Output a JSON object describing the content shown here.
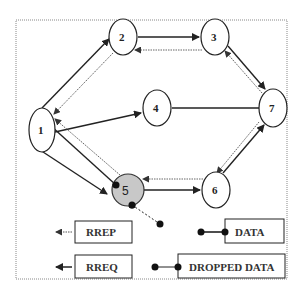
{
  "diagram": {
    "type": "network-routing",
    "nodes": [
      {
        "id": "1",
        "label": "1"
      },
      {
        "id": "2",
        "label": "2"
      },
      {
        "id": "3",
        "label": "3"
      },
      {
        "id": "4",
        "label": "4"
      },
      {
        "id": "5",
        "label": "5",
        "highlighted": true,
        "fill": "#c8c8c8"
      },
      {
        "id": "6",
        "label": "6"
      },
      {
        "id": "7",
        "label": "7"
      }
    ],
    "edges": [
      {
        "from": "1",
        "to": "2",
        "type": "RREQ"
      },
      {
        "from": "2",
        "to": "1",
        "type": "RREP"
      },
      {
        "from": "2",
        "to": "3",
        "type": "RREQ"
      },
      {
        "from": "3",
        "to": "2",
        "type": "RREP"
      },
      {
        "from": "3",
        "to": "7",
        "type": "RREQ"
      },
      {
        "from": "7",
        "to": "3",
        "type": "RREP"
      },
      {
        "from": "1",
        "to": "4",
        "type": "RREQ"
      },
      {
        "from": "4",
        "to": "7",
        "type": "link"
      },
      {
        "from": "6",
        "to": "7",
        "type": "RREQ"
      },
      {
        "from": "7",
        "to": "6",
        "type": "RREP"
      },
      {
        "from": "5",
        "to": "6",
        "type": "RREQ"
      },
      {
        "from": "6",
        "to": "5",
        "type": "RREP"
      },
      {
        "from": "1",
        "to": "5",
        "type": "RREQ"
      },
      {
        "from": "5",
        "to": "1",
        "type": "RREP"
      },
      {
        "from": "1",
        "to": "5",
        "type": "DATA"
      },
      {
        "from": "5",
        "to": "outside",
        "type": "DROPPED DATA"
      }
    ]
  },
  "legend": {
    "rrep": "RREP",
    "rreq": "RREQ",
    "data": "DATA",
    "dropped_data": "DROPPED DATA"
  },
  "colors": {
    "stroke": "#222222",
    "dotted": "#555555",
    "node5_fill": "#c8c8c8",
    "frame": "#888888"
  }
}
